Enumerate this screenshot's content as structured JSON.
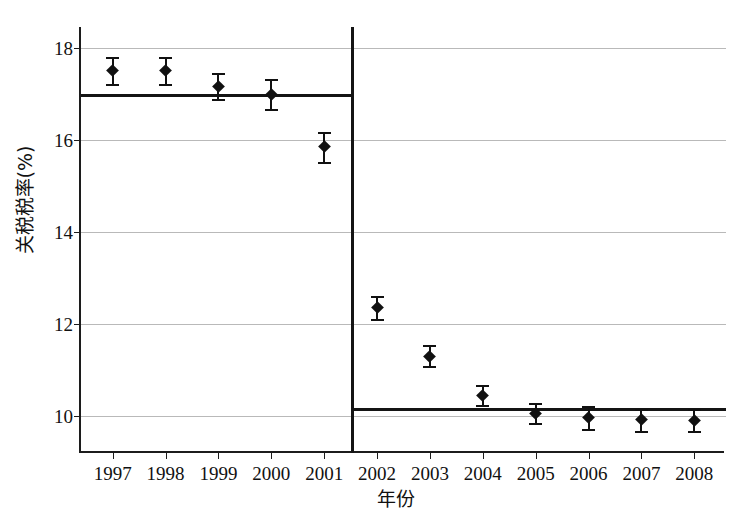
{
  "chart_data": {
    "type": "scatter",
    "title": "",
    "subtitle": "",
    "xlabel": "年份",
    "ylabel": "关税税率(%)",
    "xlim": [
      1996.4,
      2008.6
    ],
    "ylim": [
      9.2,
      18.45
    ],
    "ytick_labels": [
      "18",
      "16",
      "14",
      "12",
      "10"
    ],
    "ytick_values": [
      18,
      16,
      14,
      12,
      10
    ],
    "grid": "horizontal",
    "legend": "none",
    "categories": [
      "1997",
      "1998",
      "1999",
      "2000",
      "2001",
      "2002",
      "2003",
      "2004",
      "2005",
      "2006",
      "2007",
      "2008"
    ],
    "values": [
      17.5,
      17.5,
      17.15,
      16.98,
      15.85,
      12.35,
      11.3,
      10.45,
      10.05,
      9.98,
      9.92,
      9.9
    ],
    "error_low": [
      17.22,
      17.22,
      16.88,
      16.68,
      15.52,
      12.12,
      11.08,
      10.25,
      9.85,
      9.72,
      9.68,
      9.68
    ],
    "error_high": [
      17.8,
      17.8,
      17.45,
      17.32,
      16.18,
      12.6,
      11.55,
      10.68,
      10.28,
      10.22,
      10.16,
      10.15
    ],
    "series": [
      {
        "name": "关税税率",
        "marker": "filled-diamond-with-error-bars",
        "values": [
          17.5,
          17.5,
          17.15,
          16.98,
          15.85,
          12.35,
          11.3,
          10.45,
          10.05,
          9.98,
          9.92,
          9.9
        ]
      }
    ],
    "annotations": [
      {
        "name": "pre-period-fit-line",
        "type": "horizontal-line",
        "y": 17.0,
        "x_from": 1996.4,
        "x_to": 2001.5
      },
      {
        "name": "post-period-fit-line",
        "type": "horizontal-line",
        "y": 10.18,
        "x_from": 2001.5,
        "x_to": 2008.6
      },
      {
        "name": "discontinuity-cutoff",
        "type": "vertical-line",
        "x": 2001.5
      }
    ],
    "colors": {
      "marker": "#111111",
      "fit_line": "#141414",
      "cutoff_line": "#141414",
      "gridline": "#b9b9b9",
      "axis": "#1c1c1c",
      "background": "#ffffff"
    }
  }
}
